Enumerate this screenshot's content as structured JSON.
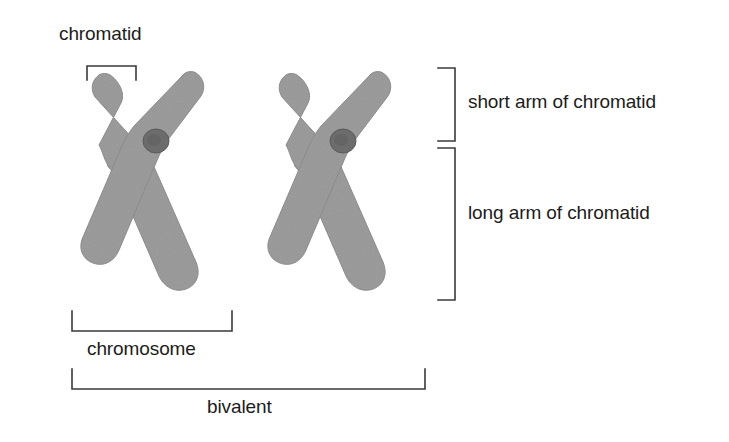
{
  "figure": {
    "background_color": "#ffffff",
    "chromatin_color": "#9d9d9d",
    "chromatin_edge_color": "#8a8a8a",
    "centromere_color": "#6f6f6f",
    "bracket_color": "#3a3a3a",
    "text_color": "#1c1c1c"
  },
  "labels": {
    "chromatid": "chromatid",
    "short_arm": "short arm of chromatid",
    "long_arm": "long arm of chromatid",
    "chromosome": "chromosome",
    "bivalent": "bivalent"
  },
  "structures": [
    {
      "name": "chromosome-left",
      "centromere_x": 156,
      "centromere_y": 141,
      "arm_tips": [
        "upper-left",
        "upper-right",
        "lower-left",
        "lower-right"
      ]
    },
    {
      "name": "chromosome-right",
      "centromere_x": 343,
      "centromere_y": 141,
      "arm_tips": [
        "upper-left",
        "upper-right",
        "lower-left",
        "lower-right"
      ]
    }
  ],
  "brackets": [
    {
      "name": "chromatid-bracket",
      "orientation": "down",
      "x_start": 87,
      "x_end": 136,
      "y": 66
    },
    {
      "name": "short-arm-bracket",
      "orientation": "left",
      "y_start": 68,
      "y_end": 141,
      "x": 455
    },
    {
      "name": "long-arm-bracket",
      "orientation": "left",
      "y_start": 148,
      "y_end": 300,
      "x": 455
    },
    {
      "name": "chromosome-bracket",
      "orientation": "up",
      "x_start": 72,
      "x_end": 232,
      "y": 331
    },
    {
      "name": "bivalent-bracket",
      "orientation": "up",
      "x_start": 72,
      "x_end": 425,
      "y": 389
    }
  ]
}
